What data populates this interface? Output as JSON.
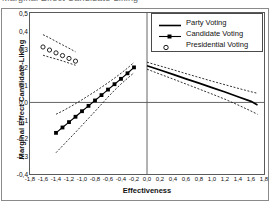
{
  "caption": {
    "text": "Marginal Effect Candidate-Liking"
  },
  "legend": {
    "position": "top-right",
    "items": [
      {
        "label": "Party Voting",
        "symbol": "solid-line",
        "color": "#000000"
      },
      {
        "label": "Candidate Voting",
        "symbol": "line-with-filled-square-markers",
        "color": "#000000"
      },
      {
        "label": "Presidential Voting",
        "symbol": "open-circle-markers",
        "color": "#000000"
      }
    ]
  },
  "chart_data": {
    "type": "line",
    "title": "",
    "xlabel": "Effectiveness",
    "ylabel": "Marginal Effect Candidate-Liking",
    "xlim": [
      -1.8,
      1.8
    ],
    "ylim": [
      -0.4,
      0.5
    ],
    "grid": false,
    "zero_line": true,
    "decimal_separator": ",",
    "xticks": [
      "-1,8",
      "-1,6",
      "-1,4",
      "-1,2",
      "-1,0",
      "-0,8",
      "-0,6",
      "-0,4",
      "-0,2",
      "0,0",
      "0,2",
      "0,4",
      "0,6",
      "0,8",
      "1,0",
      "1,2",
      "1,4",
      "1,6",
      "1,8"
    ],
    "xtick_values": [
      -1.8,
      -1.6,
      -1.4,
      -1.2,
      -1.0,
      -0.8,
      -0.6,
      -0.4,
      -0.2,
      0.0,
      0.2,
      0.4,
      0.6,
      0.8,
      1.0,
      1.2,
      1.4,
      1.6,
      1.8
    ],
    "yticks": [
      "0,5",
      "0,4",
      "0,3",
      "0,2",
      "0,1",
      "0,0",
      "-0,1",
      "-0,2",
      "-0,3",
      "-0,4"
    ],
    "ytick_values": [
      0.5,
      0.4,
      0.3,
      0.2,
      0.1,
      0.0,
      -0.1,
      -0.2,
      -0.3,
      -0.4
    ],
    "series": [
      {
        "name": "Party Voting",
        "style": "solid",
        "x": [
          0.0,
          0.2,
          0.4,
          0.6,
          0.8,
          1.0,
          1.2,
          1.4,
          1.6,
          1.7
        ],
        "values": [
          0.205,
          0.181,
          0.157,
          0.132,
          0.108,
          0.083,
          0.058,
          0.032,
          0.006,
          -0.014
        ],
        "ci_upper": [
          0.225,
          0.204,
          0.183,
          0.161,
          0.14,
          0.119,
          0.099,
          0.079,
          0.06,
          0.051
        ],
        "ci_lower": [
          0.186,
          0.158,
          0.131,
          0.103,
          0.075,
          0.047,
          0.018,
          -0.014,
          -0.048,
          -0.066
        ]
      },
      {
        "name": "Candidate Voting",
        "style": "solid-with-markers",
        "x": [
          -1.4,
          -1.3,
          -1.2,
          -1.1,
          -1.0,
          -0.9,
          -0.8,
          -0.7,
          -0.6,
          -0.5,
          -0.4,
          -0.3,
          -0.2
        ],
        "values": [
          -0.17,
          -0.14,
          -0.11,
          -0.08,
          -0.049,
          -0.019,
          0.011,
          0.041,
          0.072,
          0.102,
          0.132,
          0.163,
          0.196
        ],
        "ci_upper": [
          -0.066,
          -0.048,
          -0.028,
          -0.007,
          0.015,
          0.038,
          0.061,
          0.085,
          0.11,
          0.136,
          0.163,
          0.192,
          0.224
        ],
        "ci_lower": [
          -0.281,
          -0.243,
          -0.205,
          -0.167,
          -0.128,
          -0.089,
          -0.05,
          -0.01,
          0.03,
          0.068,
          0.103,
          0.135,
          0.166
        ]
      },
      {
        "name": "Presidential Voting",
        "style": "open-circles",
        "x": [
          -1.6,
          -1.5,
          -1.4,
          -1.3,
          -1.2,
          -1.1
        ],
        "values": [
          0.31,
          0.293,
          0.277,
          0.262,
          0.246,
          0.231
        ],
        "ci_upper": [
          0.379,
          0.361,
          0.341,
          0.322,
          0.303,
          0.283
        ],
        "ci_lower": [
          0.264,
          0.253,
          0.243,
          0.232,
          0.22,
          0.208
        ]
      }
    ]
  }
}
